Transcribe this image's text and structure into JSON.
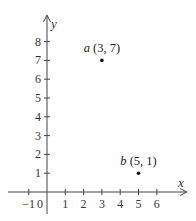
{
  "chart_data": {
    "type": "scatter",
    "title": "",
    "xlabel": "x",
    "ylabel": "y",
    "xlim": [
      -1,
      7
    ],
    "ylim": [
      0,
      9
    ],
    "grid": false,
    "x_ticks": [
      -1,
      0,
      1,
      2,
      3,
      4,
      5,
      6
    ],
    "y_ticks": [
      1,
      2,
      3,
      4,
      5,
      6,
      7,
      8
    ],
    "x_tick_labels": [
      "−1",
      "0",
      "1",
      "2",
      "3",
      "4",
      "5",
      "6"
    ],
    "y_tick_labels": [
      "1",
      "2",
      "3",
      "4",
      "5",
      "6",
      "7",
      "8"
    ],
    "points": [
      {
        "name": "a",
        "x": 3,
        "y": 7,
        "label": "(3, 7)"
      },
      {
        "name": "b",
        "x": 5,
        "y": 1,
        "label": "(5, 1)"
      }
    ]
  },
  "colors": {
    "axis": "#444444",
    "point": "#111111",
    "text": "#333333"
  }
}
